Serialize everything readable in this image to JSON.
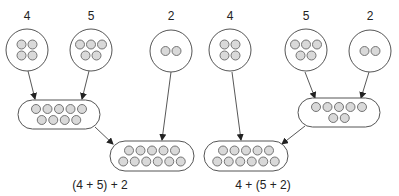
{
  "diagrams": [
    {
      "expression": "(4 + 5) + 2",
      "groups": [
        {
          "id": "a",
          "label": "4",
          "count": 4,
          "rows": [
            2,
            2
          ]
        },
        {
          "id": "b",
          "label": "5",
          "count": 5,
          "rows": [
            3,
            2
          ]
        },
        {
          "id": "c",
          "label": "2",
          "count": 2,
          "rows": [
            2
          ]
        }
      ],
      "intermediate": {
        "sum_of": [
          "4",
          "5"
        ],
        "count": 9,
        "rows": [
          5,
          4
        ]
      },
      "result": {
        "count": 11,
        "rows": [
          5,
          6
        ]
      }
    },
    {
      "expression": "4 + (5 + 2)",
      "groups": [
        {
          "id": "a",
          "label": "4",
          "count": 4,
          "rows": [
            2,
            2
          ]
        },
        {
          "id": "b",
          "label": "5",
          "count": 5,
          "rows": [
            3,
            2
          ]
        },
        {
          "id": "c",
          "label": "2",
          "count": 2,
          "rows": [
            2
          ]
        }
      ],
      "intermediate": {
        "sum_of": [
          "5",
          "2"
        ],
        "count": 7,
        "rows": [
          5,
          2
        ]
      },
      "result": {
        "count": 11,
        "rows": [
          5,
          6
        ]
      }
    }
  ],
  "colors": {
    "dot_fill": "#d9d9d9",
    "outline": "#555555"
  }
}
